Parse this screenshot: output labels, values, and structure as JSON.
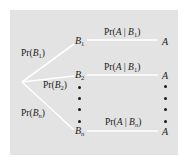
{
  "diagram": {
    "type": "probability-tree",
    "colors": {
      "panel_background": "#e3e3e3",
      "branch_lines": "#ffffff",
      "text": "#1a1a1a"
    },
    "root_branches": [
      {
        "label_fn": "Pr(",
        "label_var": "B",
        "label_sub": "1",
        "label_close": ")"
      },
      {
        "label_fn": "Pr(",
        "label_var": "B",
        "label_sub": "2",
        "label_close": ")"
      },
      {
        "label_fn": "Pr(",
        "label_var": "B",
        "label_sub": "n",
        "label_close": ")"
      }
    ],
    "middle_nodes": [
      {
        "var": "B",
        "sub": "1"
      },
      {
        "var": "B",
        "sub": "2"
      },
      {
        "var": "B",
        "sub": "n"
      }
    ],
    "second_branches": [
      {
        "label_fn": "Pr(",
        "label_a": "A",
        "label_bar": " | ",
        "label_var": "B",
        "label_sub": "1",
        "label_close": ")"
      },
      {
        "label_fn": "Pr(",
        "label_a": "A",
        "label_bar": " | ",
        "label_var": "B",
        "label_sub": "1",
        "label_close": ")"
      },
      {
        "label_fn": "Pr(",
        "label_a": "A",
        "label_bar": " | ",
        "label_var": "B",
        "label_sub": "n",
        "label_close": ")"
      }
    ],
    "leaf_nodes": [
      {
        "var": "A"
      },
      {
        "var": "A"
      },
      {
        "var": "A"
      }
    ],
    "ellipsis_dots_count": 4
  }
}
